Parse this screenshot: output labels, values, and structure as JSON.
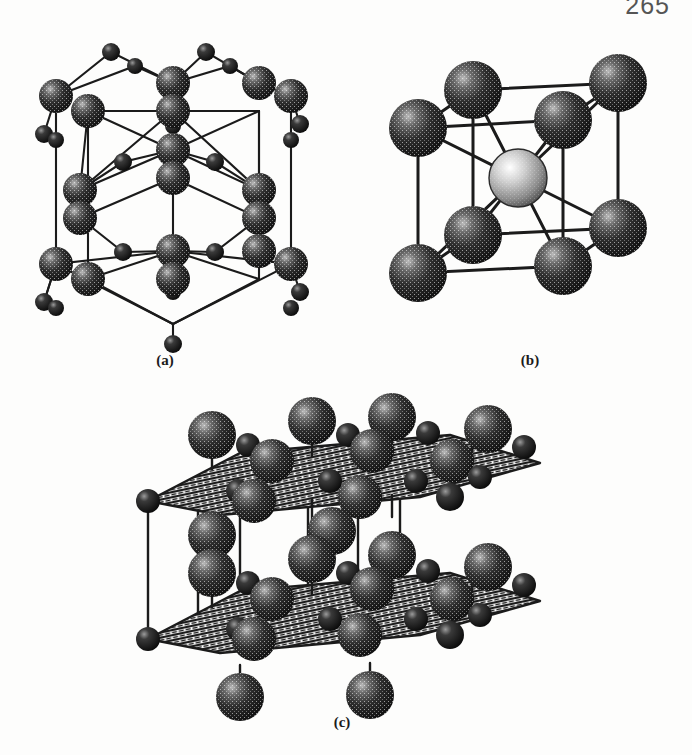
{
  "page": {
    "number": "265",
    "background_color": "#fdfdfc",
    "ink_color": "#1b1b1b"
  },
  "figure": {
    "kind": "crystal-structure-diagram",
    "panels": [
      {
        "id": "a",
        "caption": "(a)",
        "structure_name": "hexagonal layered lattice",
        "large_atom_color": "#262626",
        "small_atom_color": "#141414",
        "bond_color": "#1b1b1b",
        "large_atom_radius": 11,
        "small_atom_radius": 6,
        "large_atoms": [
          [
            46,
            82
          ],
          [
            78,
            97
          ],
          [
            78,
            69
          ],
          [
            163,
            69
          ],
          [
            163,
            97
          ],
          [
            249,
            69
          ],
          [
            249,
            97
          ],
          [
            281,
            82
          ],
          [
            70,
            176
          ],
          [
            70,
            204
          ],
          [
            163,
            136
          ],
          [
            163,
            164
          ],
          [
            249,
            176
          ],
          [
            249,
            204
          ],
          [
            113,
            148
          ],
          [
            205,
            148
          ],
          [
            113,
            238
          ],
          [
            205,
            238
          ],
          [
            46,
            250
          ],
          [
            78,
            265
          ],
          [
            78,
            237
          ],
          [
            163,
            237
          ],
          [
            163,
            265
          ],
          [
            249,
            237
          ],
          [
            249,
            265
          ],
          [
            281,
            250
          ]
        ],
        "small_atoms": [
          [
            101,
            38
          ],
          [
            196,
            38
          ],
          [
            34,
            120
          ],
          [
            125,
            52
          ],
          [
            220,
            52
          ],
          [
            290,
            110
          ],
          [
            101,
            206
          ],
          [
            196,
            206
          ],
          [
            34,
            288
          ],
          [
            125,
            220
          ],
          [
            220,
            220
          ],
          [
            290,
            278
          ],
          [
            163,
            112
          ],
          [
            163,
            310
          ],
          [
            46,
            126
          ],
          [
            281,
            126
          ],
          [
            46,
            294
          ],
          [
            281,
            294
          ],
          [
            125,
            172
          ],
          [
            220,
            172
          ]
        ]
      },
      {
        "id": "b",
        "caption": "(b)",
        "structure_name": "body-centered cubic unit cell",
        "corner_atom_color": "#1a1a1a",
        "center_atom_color": "#8f8f8f",
        "bond_color": "#1b1b1b",
        "corner_atom_radius": 25,
        "center_atom_radius": 25,
        "corner_atoms": [
          [
            40,
            50
          ],
          [
            185,
            42
          ],
          [
            40,
            195
          ],
          [
            185,
            188
          ],
          [
            95,
            12
          ],
          [
            240,
            5
          ],
          [
            95,
            157
          ],
          [
            240,
            150
          ]
        ],
        "center_atom": [
          140,
          100
        ],
        "atom_count_corners": 8,
        "atom_count_center": 1
      },
      {
        "id": "c",
        "caption": "(c)",
        "structure_name": "layered structure with two hatched basal planes",
        "plane_fill": "hatched",
        "plane_color": "#1b1b1b",
        "large_atom_color": "#262626",
        "small_atom_color": "#141414",
        "large_atom_radius": 19,
        "small_atom_radius": 10,
        "plane_count": 2,
        "upper_plane_y": 62,
        "lower_plane_y": 200,
        "large_atoms_upper": [
          [
            110,
            40
          ],
          [
            190,
            26
          ],
          [
            272,
            22
          ],
          [
            350,
            38
          ],
          [
            112,
            120
          ],
          [
            192,
            100
          ],
          [
            278,
            96
          ],
          [
            356,
            112
          ]
        ],
        "large_atoms_lower": [
          [
            108,
            178
          ],
          [
            188,
            164
          ],
          [
            270,
            160
          ],
          [
            348,
            176
          ],
          [
            110,
            258
          ],
          [
            190,
            238
          ],
          [
            276,
            234
          ],
          [
            354,
            250
          ]
        ],
        "small_atoms": [
          [
            60,
            82
          ],
          [
            140,
            62
          ],
          [
            224,
            58
          ],
          [
            304,
            74
          ],
          [
            58,
            220
          ],
          [
            138,
            200
          ],
          [
            222,
            196
          ],
          [
            302,
            212
          ],
          [
            150,
            42
          ],
          [
            232,
            38
          ],
          [
            330,
            62
          ],
          [
            408,
            60
          ],
          [
            148,
            180
          ],
          [
            230,
            176
          ],
          [
            328,
            200
          ],
          [
            406,
            198
          ]
        ]
      }
    ]
  }
}
